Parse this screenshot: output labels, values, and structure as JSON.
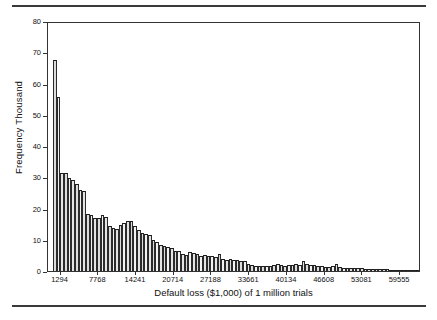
{
  "figure": {
    "top_rule": "horizontal-rule",
    "bottom_rule": "horizontal-rule"
  },
  "chart_data": {
    "type": "bar",
    "title": "",
    "subtitle": "",
    "xlabel": "Default loss ($1,000) of 1 million trials",
    "ylabel": "Frequency Thousand",
    "grid": false,
    "legend": null,
    "ylim": [
      0,
      80
    ],
    "ytick_labels": [
      "0",
      "10",
      "20",
      "30",
      "40",
      "50",
      "60",
      "70",
      "80"
    ],
    "ytick_values": [
      0,
      10,
      20,
      30,
      40,
      50,
      60,
      70,
      80
    ],
    "xtick_labels": [
      "1294",
      "7768",
      "14241",
      "20714",
      "27188",
      "33661",
      "40134",
      "46608",
      "53081",
      "59555"
    ],
    "xtick_values": [
      1294,
      7768,
      14241,
      20714,
      27188,
      33661,
      40134,
      46608,
      53081,
      59555
    ],
    "xlim": [
      0,
      64000
    ],
    "bin_width": 647,
    "categories": [
      "647",
      "1294",
      "1941",
      "2588",
      "3235",
      "3882",
      "4529",
      "5176",
      "5823",
      "6470",
      "7117",
      "7768",
      "8415",
      "9062",
      "9709",
      "10356",
      "11003",
      "11650",
      "12297",
      "12944",
      "13591",
      "14241",
      "14888",
      "15535",
      "16182",
      "16829",
      "17476",
      "18123",
      "18770",
      "19417",
      "20064",
      "20714",
      "21361",
      "22008",
      "22655",
      "23302",
      "23949",
      "24596",
      "25243",
      "25890",
      "26537",
      "27188",
      "27835",
      "28482",
      "29129",
      "29776",
      "30423",
      "31070",
      "31717",
      "32364",
      "33011",
      "33661",
      "34308",
      "34955",
      "35602",
      "36249",
      "36896",
      "37543",
      "38190",
      "38837",
      "39484",
      "40134",
      "40781",
      "41428",
      "42075",
      "42722",
      "43369",
      "44016",
      "44663",
      "45310",
      "45957",
      "46608",
      "47255",
      "47902",
      "48549",
      "49196",
      "49843",
      "50490",
      "51137",
      "51784",
      "52431",
      "53081",
      "53728",
      "54375",
      "55022",
      "55669",
      "56316",
      "56963",
      "57610",
      "58257",
      "58904",
      "59555",
      "60202",
      "60849",
      "61496",
      "62143",
      "62790",
      "63437",
      "64084",
      "64731"
    ],
    "values": [
      68.0,
      56.0,
      31.5,
      31.5,
      30.0,
      29.5,
      28.0,
      26.0,
      25.8,
      18.5,
      18.0,
      17.2,
      17.0,
      18.2,
      17.5,
      14.5,
      13.8,
      13.6,
      15.0,
      15.5,
      16.2,
      16.0,
      14.5,
      13.2,
      12.2,
      11.8,
      11.5,
      10.0,
      9.2,
      8.5,
      8.2,
      7.8,
      7.5,
      6.5,
      6.6,
      5.5,
      5.2,
      6.0,
      5.8,
      5.5,
      5.0,
      5.2,
      4.8,
      5.0,
      4.6,
      5.5,
      4.0,
      3.6,
      3.8,
      3.5,
      3.5,
      3.2,
      3.2,
      2.4,
      2.0,
      1.7,
      1.6,
      1.7,
      1.6,
      1.5,
      1.9,
      2.2,
      1.8,
      1.7,
      2.0,
      1.9,
      2.2,
      2.1,
      3.2,
      2.3,
      2.0,
      1.8,
      1.6,
      1.6,
      1.4,
      1.4,
      1.5,
      2.2,
      1.3,
      1.1,
      1.0,
      1.0,
      0.9,
      0.9,
      1.0,
      0.8,
      0.7,
      0.8,
      0.7,
      0.6,
      0.5,
      0.5,
      0.4,
      0.4,
      0.3,
      0.3,
      0.25,
      0.2,
      0.2,
      0.2
    ]
  }
}
